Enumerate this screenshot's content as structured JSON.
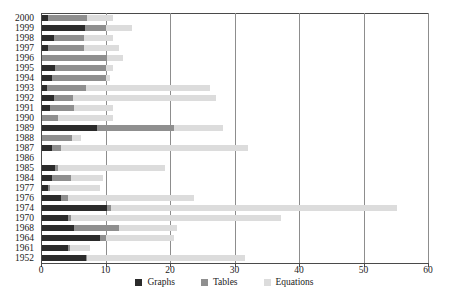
{
  "chart_data": {
    "type": "bar",
    "orientation": "horizontal",
    "stacked": true,
    "title": "",
    "subtitle": "",
    "xlabel": "",
    "ylabel": "",
    "xlim": [
      0,
      60
    ],
    "ylim": null,
    "xticks": [
      0,
      10,
      20,
      30,
      40,
      50,
      60
    ],
    "xtick_labels": [
      "0",
      "10",
      "20",
      "30",
      "40",
      "50",
      "60"
    ],
    "grid": "vertical",
    "legend_position": "bottom-center",
    "categories": [
      "2000",
      "1999",
      "1998",
      "1997",
      "1996",
      "1995",
      "1994",
      "1993",
      "1992",
      "1991",
      "1990",
      "1989",
      "1988",
      "1987",
      "1986",
      "1985",
      "1984",
      "1977",
      "1976",
      "1974",
      "1970",
      "1968",
      "1964",
      "1961",
      "1952"
    ],
    "series": [
      {
        "name": "Graphs",
        "color": "#2b2b2b",
        "values": [
          1.0,
          6.7,
          1.8,
          1.0,
          0.0,
          2.0,
          1.5,
          0.8,
          1.8,
          1.3,
          0.0,
          8.5,
          0.0,
          1.5,
          0.0,
          2.0,
          1.5,
          1.0,
          3.0,
          10.0,
          4.0,
          5.0,
          9.0,
          4.0,
          6.8
        ]
      },
      {
        "name": "Tables",
        "color": "#8f8f8f",
        "values": [
          6.0,
          3.3,
          4.7,
          5.5,
          10.0,
          8.0,
          8.5,
          6.0,
          3.0,
          3.7,
          2.5,
          11.9,
          4.7,
          1.5,
          0.0,
          0.5,
          3.0,
          0.2,
          1.0,
          0.7,
          0.5,
          7.0,
          1.0,
          0.3,
          0.2
        ]
      },
      {
        "name": "Equations",
        "color": "#dcdcdc",
        "values": [
          4.0,
          4.0,
          4.5,
          5.5,
          2.5,
          1.0,
          0.5,
          19.2,
          22.2,
          6.0,
          8.5,
          7.6,
          1.3,
          29.0,
          0.0,
          16.5,
          5.0,
          7.8,
          19.5,
          44.3,
          32.5,
          9.0,
          10.5,
          3.2,
          24.5
        ]
      }
    ]
  },
  "legend": {
    "items": [
      {
        "label": "Graphs",
        "color": "#2b2b2b"
      },
      {
        "label": "Tables",
        "color": "#8f8f8f"
      },
      {
        "label": "Equations",
        "color": "#dcdcdc"
      }
    ]
  }
}
